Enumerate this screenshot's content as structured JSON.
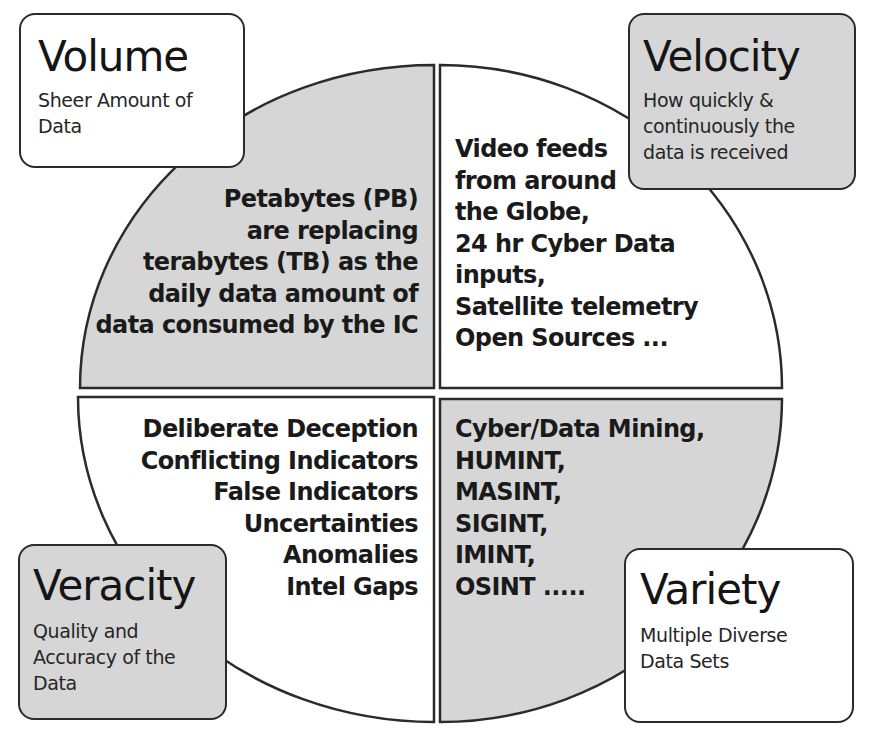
{
  "colors": {
    "gray_fill": "#d6d6d6",
    "white_fill": "#ffffff",
    "stroke": "#2b2b2b",
    "text": "#1a1a1a"
  },
  "quadrants": {
    "top_left": {
      "fill": "gray",
      "lines": [
        "Petabytes (PB)",
        "are replacing",
        "terabytes (TB) as the",
        "daily data amount of",
        "data consumed by the IC"
      ]
    },
    "top_right": {
      "fill": "white",
      "lines": [
        "Video feeds",
        "from around",
        "the Globe,",
        "24 hr Cyber Data",
        "inputs,",
        "Satellite telemetry",
        "Open Sources ..."
      ]
    },
    "bottom_left": {
      "fill": "white",
      "lines": [
        "Deliberate Deception",
        "Conflicting Indicators",
        "False Indicators",
        "Uncertainties",
        "Anomalies",
        "Intel Gaps"
      ]
    },
    "bottom_right": {
      "fill": "gray",
      "lines": [
        "Cyber/Data Mining,",
        "HUMINT,",
        "MASINT,",
        "SIGINT,",
        "IMINT,",
        "OSINT ....."
      ]
    }
  },
  "callouts": {
    "volume": {
      "title": "Volume",
      "subtitle_lines": [
        "Sheer Amount of",
        "Data"
      ],
      "fill": "white"
    },
    "velocity": {
      "title": "Velocity",
      "subtitle_lines": [
        "How quickly &",
        "continuously the",
        "data is received"
      ],
      "fill": "gray"
    },
    "veracity": {
      "title": "Veracity",
      "subtitle_lines": [
        "Quality and",
        "Accuracy of the",
        "Data"
      ],
      "fill": "gray"
    },
    "variety": {
      "title": "Variety",
      "subtitle_lines": [
        "Multiple Diverse",
        "Data Sets"
      ],
      "fill": "white"
    }
  }
}
